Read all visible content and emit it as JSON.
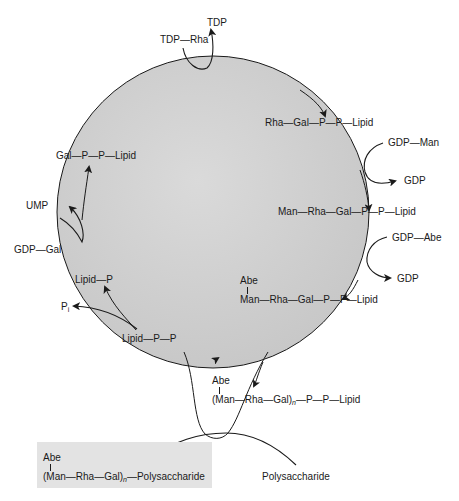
{
  "diagram": {
    "title": "",
    "type": "cycle",
    "cycle_center_fill": "#d4d4d4",
    "product_box_fill": "#e3e3e3",
    "top": {
      "donor": "TDP—Rha",
      "released": "TDP"
    },
    "intermediates": [
      {
        "id": "rha-gal-pp-lipid",
        "label": "Rha—Gal—P—P—Lipid"
      },
      {
        "id": "man-rha-gal-pp-lipid",
        "label": "Man—Rha—Gal—P—P—Lipid"
      },
      {
        "id": "abe-man-rha-gal-pp-lipid",
        "branch": "Abe",
        "label": "Man—Rha—Gal—P—P—Lipid"
      },
      {
        "id": "gal-pp-lipid",
        "label": "Gal—P—P—Lipid"
      },
      {
        "id": "lipid-p",
        "label": "Lipid—P"
      },
      {
        "id": "lipid-pp",
        "label": "Lipid—P—P"
      }
    ],
    "inputs": {
      "man": {
        "donor": "GDP—Man",
        "released": "GDP"
      },
      "abe": {
        "donor": "GDP—Abe",
        "released": "GDP"
      },
      "gal": {
        "donor": "GDP—Gal",
        "released": "UMP"
      },
      "pi": {
        "released": "Pi",
        "main": "P",
        "sub": "i"
      }
    },
    "polymer": {
      "branch": "Abe",
      "prefix": "(Man—Rha—Gal)",
      "subscript": "n",
      "suffix": "—P—P—Lipid"
    },
    "acceptor": {
      "label": "Polysaccharide"
    },
    "product": {
      "branch": "Abe",
      "prefix": "(Man—Rha—Gal)",
      "subscript": "n",
      "suffix": "—Polysaccharide"
    }
  }
}
